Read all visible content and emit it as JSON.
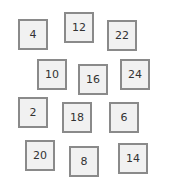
{
  "tiles": [
    {
      "label": "4",
      "x": 18,
      "y": 19
    },
    {
      "label": "12",
      "x": 64,
      "y": 12
    },
    {
      "label": "22",
      "x": 107,
      "y": 20
    },
    {
      "label": "10",
      "x": 37,
      "y": 59
    },
    {
      "label": "16",
      "x": 78,
      "y": 64
    },
    {
      "label": "24",
      "x": 120,
      "y": 59
    },
    {
      "label": "2",
      "x": 18,
      "y": 97
    },
    {
      "label": "18",
      "x": 62,
      "y": 102
    },
    {
      "label": "6",
      "x": 109,
      "y": 102
    },
    {
      "label": "20",
      "x": 25,
      "y": 140
    },
    {
      "label": "8",
      "x": 69,
      "y": 146
    },
    {
      "label": "14",
      "x": 118,
      "y": 143
    }
  ],
  "colors": {
    "tile_fill": "#f1f1f1",
    "tile_border": "#8a8a8a",
    "tile_text": "#333333",
    "background": "#ffffff"
  }
}
